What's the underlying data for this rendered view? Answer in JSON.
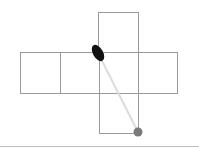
{
  "diagram": {
    "type": "cube-net",
    "colors": {
      "background": "#ffffff",
      "grid_line": "#9a9a9a",
      "connector": "#dcdcdc",
      "start_marker": "#111111",
      "end_marker": "#7a7a7a",
      "baseline": "#bdbdbd"
    },
    "cells": [
      {
        "name": "top",
        "x": 98,
        "y": 12,
        "w": 40,
        "h": 40
      },
      {
        "name": "left-outer",
        "x": 20,
        "y": 52,
        "w": 40,
        "h": 41
      },
      {
        "name": "left-inner",
        "x": 60,
        "y": 52,
        "w": 39,
        "h": 41
      },
      {
        "name": "center",
        "x": 99,
        "y": 52,
        "w": 39,
        "h": 41
      },
      {
        "name": "right",
        "x": 138,
        "y": 52,
        "w": 39,
        "h": 41
      },
      {
        "name": "bottom",
        "x": 99,
        "y": 93,
        "w": 39,
        "h": 40
      }
    ],
    "connector": {
      "x1": 98,
      "y1": 53,
      "x2": 138,
      "y2": 132
    },
    "start_marker": {
      "cx": 98,
      "cy": 53,
      "rx": 5,
      "ry": 9,
      "rotate": -30
    },
    "end_marker": {
      "cx": 138,
      "cy": 132,
      "r": 4.5
    }
  }
}
